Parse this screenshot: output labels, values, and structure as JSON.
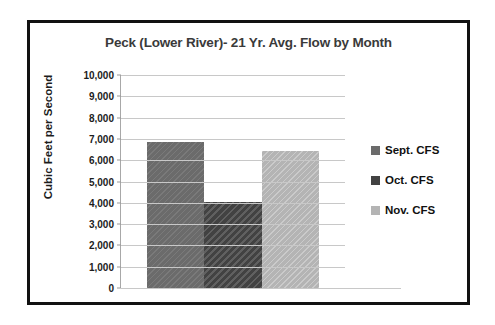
{
  "chart_data": {
    "type": "bar",
    "title": "Peck (Lower River)- 21 Yr. Avg. Flow by Month",
    "xlabel": "",
    "ylabel": "Cubic Feet per Second",
    "categories": [
      "Sept. CFS",
      "Oct. CFS",
      "Nov. CFS"
    ],
    "values": [
      6850,
      4050,
      6450
    ],
    "ylim": [
      0,
      10000
    ],
    "ytick_values": [
      10000,
      9000,
      8000,
      7000,
      6000,
      5000,
      4000,
      3000,
      2000,
      1000,
      0
    ],
    "ytick_labels": [
      "10,000",
      "9,000",
      "8,000",
      "7,000",
      "6,000",
      "5,000",
      "4,000",
      "3,000",
      "2,000",
      "1,000",
      "0"
    ],
    "grid": true,
    "legend_position": "right",
    "series": [
      {
        "name": "Sept. CFS",
        "value": 6850,
        "color": "#6b6b6b"
      },
      {
        "name": "Oct. CFS",
        "value": 4050,
        "color": "#424242"
      },
      {
        "name": "Nov. CFS",
        "value": 6450,
        "color": "#b4b4b4"
      }
    ]
  },
  "legend": {
    "items": [
      {
        "label": "Sept. CFS",
        "color": "#6b6b6b"
      },
      {
        "label": "Oct. CFS",
        "color": "#424242"
      },
      {
        "label": "Nov. CFS",
        "color": "#b4b4b4"
      }
    ]
  },
  "frame": {
    "border_color": "#111111"
  }
}
